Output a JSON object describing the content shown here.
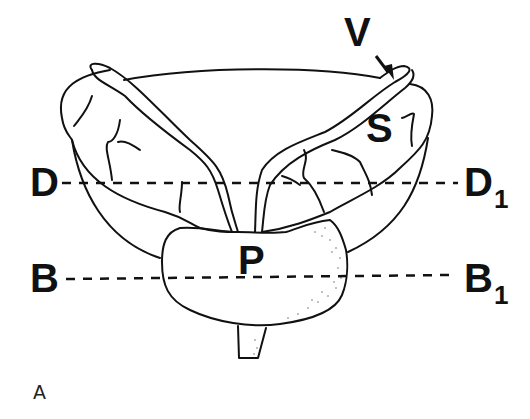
{
  "figure": {
    "panel_label": "A",
    "structures": {
      "vas_deferens": "V",
      "seminal_vesicle": "S",
      "prostate": "P"
    },
    "section_lines": [
      {
        "start": "D",
        "end_base": "D",
        "end_sub": "1"
      },
      {
        "start": "B",
        "end_base": "B",
        "end_sub": "1"
      }
    ],
    "colors": {
      "line": "#111111",
      "background": "#ffffff"
    }
  }
}
